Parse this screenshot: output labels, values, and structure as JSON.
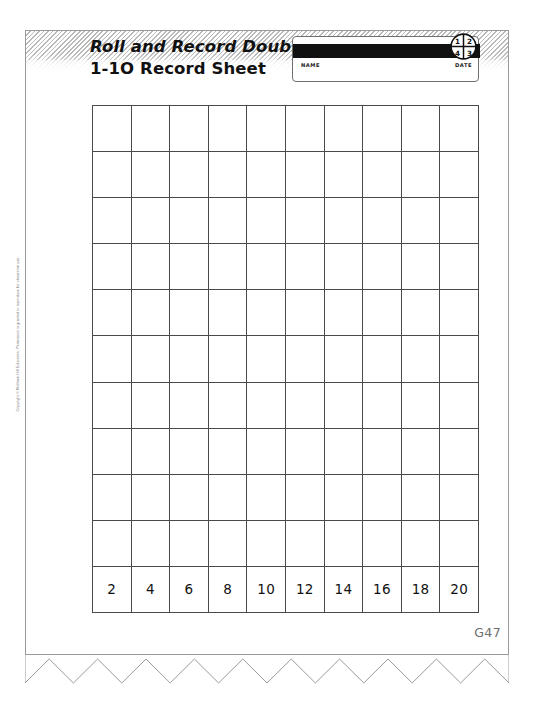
{
  "worksheet": {
    "title_line1": "Roll and Record Doubles",
    "title_line2": "1-1O Record Sheet",
    "page_code": "G47",
    "copyright": "Copyright © McGraw-Hill Education. Permission is granted to reproduce for classroom use.",
    "name_date": {
      "name_label": "NAME",
      "date_label": "DATE"
    },
    "logo": {
      "name": "quartered-circle-logo",
      "quadrant_top_left": "1",
      "quadrant_top_right": "2",
      "quadrant_bottom_left": "4",
      "quadrant_bottom_right": "3"
    }
  },
  "colors": {
    "ink": "#111111",
    "grid_line": "#4a4a4a",
    "page_border": "#9a9a9a",
    "muted_text": "#6e6e6e",
    "bar_fill": "#111111"
  },
  "chart_data": {
    "type": "table",
    "title": "Roll and Record Doubles 1-1O Record Sheet",
    "columns": 10,
    "rows": 11,
    "blank_rows": 10,
    "categories": [
      "2",
      "4",
      "6",
      "8",
      "10",
      "12",
      "14",
      "16",
      "18",
      "20"
    ],
    "values": [
      0,
      0,
      0,
      0,
      0,
      0,
      0,
      0,
      0,
      0
    ],
    "xlabel": "Doubles sum",
    "ylabel": "Tally of rolls",
    "grid": true,
    "legend": "none"
  }
}
